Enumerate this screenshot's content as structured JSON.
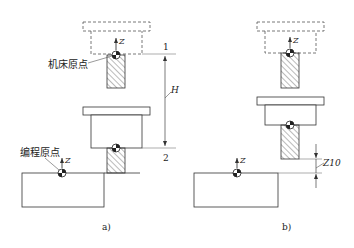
{
  "diagram": {
    "colors": {
      "stroke": "#333333",
      "dim_stroke": "#555555",
      "hatch": "#555555",
      "background": "#ffffff"
    },
    "panel_a": {
      "caption": "a)",
      "machine_origin_label": "机床原点",
      "program_origin_label": "编程原点",
      "axis_label": "Z",
      "level_1_label": "1",
      "level_2_label": "2",
      "dimension_label": "H"
    },
    "panel_b": {
      "caption": "b)",
      "axis_label": "Z",
      "dimension_label": "Z10"
    }
  }
}
